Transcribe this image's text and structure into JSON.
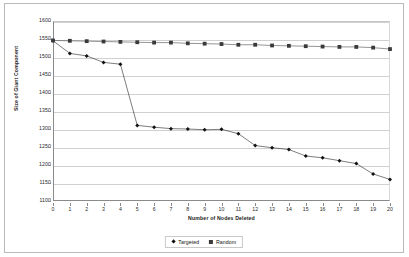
{
  "chart_data": {
    "type": "line",
    "title": "",
    "xlabel": "Number of Nodes Deleted",
    "ylabel": "Size of Giant Component",
    "xlim": [
      0,
      20
    ],
    "ylim": [
      1100,
      1600
    ],
    "ytick_step": 50,
    "grid": true,
    "legend_position": "bottom",
    "x": [
      0,
      1,
      2,
      3,
      4,
      5,
      6,
      7,
      8,
      9,
      10,
      11,
      12,
      13,
      14,
      15,
      16,
      17,
      18,
      19,
      20
    ],
    "xticklabels": [
      "0",
      "1",
      "2",
      "3",
      "4",
      "5",
      "6",
      "7",
      "8",
      "9",
      "10",
      "11",
      "12",
      "13",
      "14",
      "15",
      "16",
      "17",
      "18",
      "19",
      "20"
    ],
    "yticklabels": [
      "1100",
      "1150",
      "1200",
      "1250",
      "1300",
      "1350",
      "1400",
      "1450",
      "1500",
      "1550",
      "1600"
    ],
    "yticks": [
      1100,
      1150,
      1200,
      1250,
      1300,
      1350,
      1400,
      1450,
      1500,
      1550,
      1600
    ],
    "series": [
      {
        "name": "Targeted",
        "marker": "diamond",
        "color": "#111111",
        "values": [
          1545,
          1510,
          1503,
          1485,
          1480,
          1310,
          1305,
          1301,
          1300,
          1298,
          1299,
          1287,
          1254,
          1248,
          1243,
          1225,
          1220,
          1212,
          1204,
          1175,
          1160
        ]
      },
      {
        "name": "Random",
        "marker": "square",
        "color": "#3a3a3a",
        "values": [
          1546,
          1545,
          1544,
          1543,
          1542,
          1541,
          1540,
          1540,
          1538,
          1537,
          1536,
          1534,
          1534,
          1532,
          1531,
          1530,
          1529,
          1528,
          1528,
          1526,
          1522
        ]
      }
    ]
  },
  "legend": {
    "items": [
      {
        "label": "Targeted",
        "marker": "diamond"
      },
      {
        "label": "Random",
        "marker": "square"
      }
    ]
  }
}
